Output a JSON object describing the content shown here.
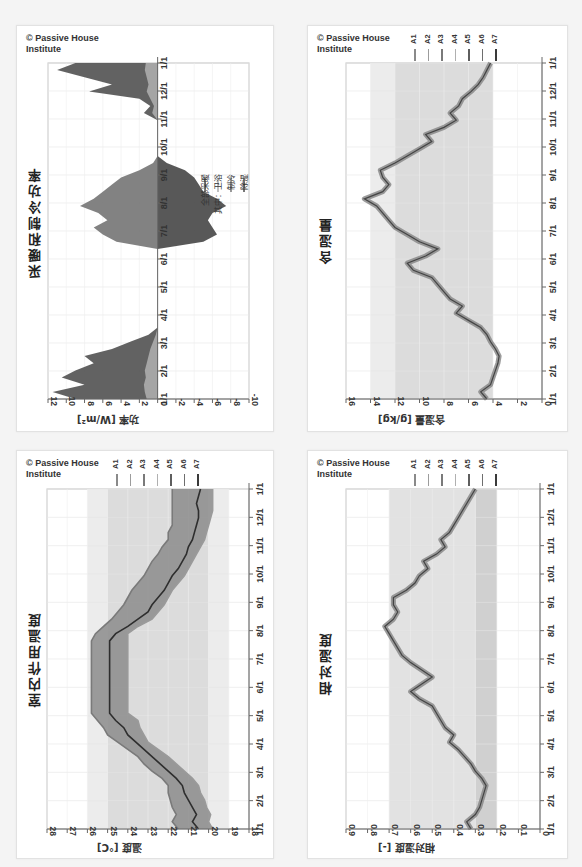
{
  "copyright": "© Passive House Institute",
  "copyright_lines": [
    "© Passive House",
    "Institute"
  ],
  "date_ticks": [
    "1/1",
    "2/1",
    "3/1",
    "4/1",
    "5/1",
    "6/1",
    "7/1",
    "8/1",
    "9/1",
    "10/1",
    "11/1",
    "12/1",
    "1/1"
  ],
  "colors": {
    "A1": "#8a8a8a",
    "A2": "#9c9c9c",
    "A3": "#7a7a7a",
    "A4": "#b0b0b0",
    "A5": "#5e5e5e",
    "A6": "#6e6e6e",
    "A7": "#3a3a3a",
    "heating": "#555555",
    "bath": "#aaaaaa",
    "cooling": "#777777",
    "dehum": "#4a4a4a"
  },
  "chart_data": [
    {
      "id": "power",
      "type": "area",
      "title": "采暖和制冷功率",
      "ylabel": "功率 [W/m²]",
      "xlabel": "",
      "ylim": [
        -10,
        12
      ],
      "yticks": [
        12,
        10,
        8,
        6,
        4,
        2,
        0,
        -2,
        -4,
        -6,
        -8,
        -10
      ],
      "categories": [
        "1/1",
        "2/1",
        "3/1",
        "4/1",
        "5/1",
        "6/1",
        "7/1",
        "8/1",
        "9/1",
        "10/1",
        "11/1",
        "12/1",
        "1/1"
      ],
      "legend": [
        "全部采暖",
        "其中：卫浴",
        "制冷",
        "除湿"
      ],
      "bands": [],
      "series": [
        {
          "name": "全部采暖",
          "values": [
            9,
            11.5,
            8,
            10.5,
            9,
            7,
            8,
            5,
            3,
            1,
            0,
            0,
            0,
            0,
            0,
            0,
            0,
            0,
            0,
            0,
            0,
            0,
            0,
            0,
            0,
            0,
            0,
            0,
            0,
            0,
            0,
            0,
            0,
            0,
            0,
            0,
            0,
            0,
            0,
            0,
            1.5,
            0.8,
            2,
            7.5,
            5,
            8,
            11,
            9
          ]
        },
        {
          "name": "其中：卫浴",
          "values": [
            1.2,
            1.4,
            1.5,
            1.3,
            1.4,
            1.2,
            1,
            0.8,
            0.5,
            0.2,
            0,
            0,
            0,
            0,
            0,
            0,
            0,
            0,
            0,
            0,
            0,
            0,
            0,
            0,
            0,
            0,
            0,
            0,
            0,
            0,
            0,
            0,
            0,
            0,
            0,
            0,
            0,
            0,
            0,
            0,
            0.6,
            0.4,
            0.8,
            1.2,
            1,
            1.2,
            1.4,
            1.3
          ]
        },
        {
          "name": "制冷",
          "values": [
            0,
            0,
            0,
            0,
            0,
            0,
            0,
            0,
            0,
            0,
            0,
            0,
            0,
            0,
            0,
            0,
            0,
            0,
            0,
            0,
            0,
            0,
            4.5,
            6,
            7,
            5.5,
            6.5,
            8.5,
            7,
            6,
            5,
            4,
            2,
            0.5,
            0,
            0,
            0,
            0,
            0,
            0,
            0,
            0,
            0,
            0,
            0,
            0,
            0,
            0
          ]
        },
        {
          "name": "除湿",
          "values": [
            0,
            0,
            0,
            0,
            0,
            0,
            0,
            0,
            0,
            0,
            0,
            0,
            0,
            0,
            0,
            0,
            0,
            0,
            0,
            0,
            0,
            0,
            -5,
            -6.5,
            -6,
            -5.5,
            -6,
            -7.5,
            -6.5,
            -5,
            -4.5,
            -4,
            -3,
            -1,
            0,
            0,
            0,
            0,
            0,
            0,
            0,
            0,
            0,
            0,
            0,
            0,
            0,
            0
          ]
        }
      ]
    },
    {
      "id": "moisture",
      "type": "line",
      "title": "含湿量",
      "ylabel": "含湿量 [g/kg]",
      "xlabel": "",
      "ylim": [
        0,
        16
      ],
      "yticks": [
        16,
        14,
        12,
        10,
        8,
        6,
        4,
        2,
        0
      ],
      "categories": [
        "1/1",
        "2/1",
        "3/1",
        "4/1",
        "5/1",
        "6/1",
        "7/1",
        "8/1",
        "9/1",
        "10/1",
        "11/1",
        "12/1",
        "1/1"
      ],
      "legend": [
        "A1",
        "A2",
        "A3",
        "A4",
        "A5",
        "A6",
        "A7"
      ],
      "bands": [
        {
          "from": 12,
          "to": 14,
          "color": "#ececec"
        },
        {
          "from": 4,
          "to": 12,
          "color": "#dcdcdc"
        }
      ],
      "series": [
        {
          "name": "A-all",
          "values": [
            4.5,
            5,
            4.2,
            4,
            3.8,
            3.6,
            3.5,
            3.8,
            4.2,
            4.5,
            5,
            6,
            7,
            6.5,
            7.5,
            8,
            8.5,
            9,
            10.5,
            11,
            9.5,
            8.5,
            10,
            11,
            12,
            12.5,
            13,
            13.5,
            14.5,
            13,
            12.5,
            13,
            13.2,
            12,
            11,
            10,
            9,
            9.5,
            8,
            7,
            7.5,
            6.8,
            6.5,
            5.8,
            5.2,
            4.8,
            4.5,
            4.2
          ]
        }
      ]
    },
    {
      "id": "temperature",
      "type": "line",
      "title": "室内作用温度",
      "ylabel": "温度 [°C]",
      "xlabel": "",
      "ylim": [
        18,
        28
      ],
      "yticks": [
        28,
        27,
        26,
        25,
        24,
        23,
        22,
        21,
        20,
        19,
        18
      ],
      "categories": [
        "1/1",
        "2/1",
        "3/1",
        "4/1",
        "5/1",
        "6/1",
        "7/1",
        "8/1",
        "9/1",
        "10/1",
        "11/1",
        "12/1",
        "1/1"
      ],
      "legend": [
        "A1",
        "A2",
        "A3",
        "A4",
        "A5",
        "A6",
        "A7"
      ],
      "bands": [
        {
          "from": 25,
          "to": 26,
          "color": "#ececec"
        },
        {
          "from": 20,
          "to": 25,
          "color": "#dcdcdc"
        },
        {
          "from": 19,
          "to": 20,
          "color": "#ececec"
        }
      ],
      "series": [
        {
          "name": "upper",
          "values": [
            21.5,
            21.8,
            21.6,
            21.8,
            21.9,
            22,
            22,
            22.3,
            22.8,
            23.2,
            23.5,
            24,
            24.5,
            25,
            25.2,
            25.5,
            25.8,
            25.8,
            25.8,
            25.8,
            25.8,
            25.8,
            25.8,
            25.8,
            25.8,
            25.8,
            25.8,
            25.6,
            25.2,
            24.8,
            24.5,
            24.2,
            24,
            23.8,
            23.5,
            23.2,
            23,
            22.8,
            22.5,
            22.3,
            22,
            22,
            21.8,
            21.8,
            21.8,
            21.8,
            21.8,
            21.8
          ]
        },
        {
          "name": "mid",
          "values": [
            20.5,
            20.8,
            20.6,
            20.8,
            21,
            21.2,
            21.3,
            21.6,
            22,
            22.4,
            22.8,
            23.2,
            23.6,
            24,
            24.2,
            24.6,
            24.9,
            24.9,
            24.9,
            24.9,
            24.9,
            24.9,
            24.9,
            24.9,
            24.9,
            24.9,
            24.9,
            24.6,
            24,
            23.5,
            23,
            22.8,
            22.5,
            22.2,
            22,
            21.8,
            21.5,
            21.3,
            21.1,
            21,
            20.8,
            20.7,
            20.6,
            20.5,
            20.5,
            20.6,
            20.5,
            20.4
          ]
        },
        {
          "name": "lower",
          "values": [
            19.8,
            20,
            19.9,
            20.1,
            20.2,
            20.4,
            20.5,
            20.8,
            21.2,
            21.6,
            22,
            22.5,
            23,
            23.2,
            23.4,
            23.5,
            24,
            24,
            24,
            24,
            24,
            24,
            24,
            24,
            24,
            24,
            24,
            24,
            23.5,
            22.8,
            22.5,
            22.2,
            22,
            21.8,
            21.5,
            21.2,
            21,
            20.8,
            20.6,
            20.4,
            20.2,
            20.1,
            20,
            19.9,
            19.8,
            19.8,
            19.8,
            19.8
          ]
        }
      ]
    },
    {
      "id": "rh",
      "type": "line",
      "title": "相对湿度",
      "ylabel": "相对湿度 [-]",
      "xlabel": "",
      "ylim": [
        0,
        0.9
      ],
      "yticks": [
        0.9,
        0.8,
        0.7,
        0.6,
        0.5,
        0.4,
        0.3,
        0.2,
        0.1,
        0
      ],
      "categories": [
        "1/1",
        "2/1",
        "3/1",
        "4/1",
        "5/1",
        "6/1",
        "7/1",
        "8/1",
        "9/1",
        "10/1",
        "11/1",
        "12/1",
        "1/1"
      ],
      "legend": [
        "A1",
        "A2",
        "A3",
        "A4",
        "A5",
        "A6",
        "A7"
      ],
      "bands": [
        {
          "from": 0.3,
          "to": 0.7,
          "color": "#e2e2e2"
        },
        {
          "from": 0.2,
          "to": 0.3,
          "color": "#d0d0d0"
        }
      ],
      "series": [
        {
          "name": "A-all",
          "values": [
            0.32,
            0.34,
            0.3,
            0.28,
            0.27,
            0.26,
            0.25,
            0.27,
            0.3,
            0.32,
            0.35,
            0.38,
            0.42,
            0.4,
            0.44,
            0.46,
            0.48,
            0.5,
            0.56,
            0.6,
            0.55,
            0.5,
            0.55,
            0.6,
            0.64,
            0.66,
            0.68,
            0.7,
            0.72,
            0.68,
            0.66,
            0.68,
            0.68,
            0.62,
            0.58,
            0.56,
            0.52,
            0.54,
            0.48,
            0.44,
            0.46,
            0.42,
            0.4,
            0.38,
            0.36,
            0.34,
            0.32,
            0.3
          ]
        }
      ]
    }
  ]
}
